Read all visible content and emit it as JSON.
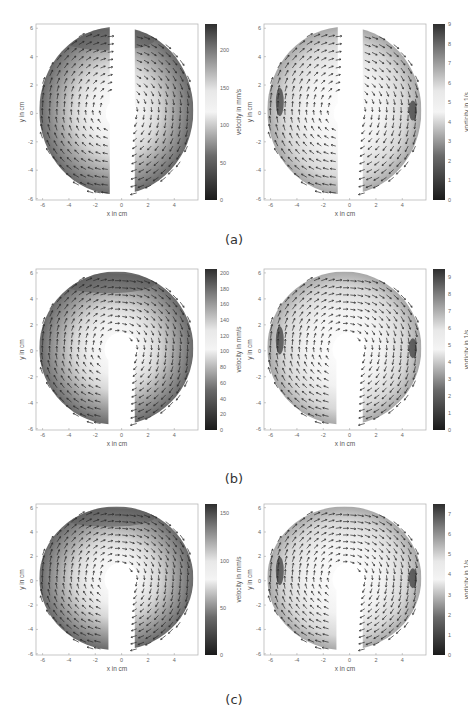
{
  "figure": {
    "rows": [
      {
        "caption": "(a)",
        "panels": [
          {
            "id": "a-velocity",
            "xlabel": "x in cm",
            "ylabel": "y in cm",
            "colorbar_label": "velocity in mm/s",
            "colorbar_ticks": [
              "0",
              "50",
              "100",
              "150",
              "200"
            ],
            "colorbar_max": 235,
            "mask": "split",
            "field": "velocity"
          },
          {
            "id": "a-vorticity",
            "xlabel": "x in cm",
            "ylabel": "y in cm",
            "colorbar_label": "vorticity in 1/s",
            "colorbar_ticks": [
              "0",
              "1",
              "2",
              "3",
              "4",
              "5",
              "6",
              "7",
              "8",
              "9"
            ],
            "colorbar_max": 9,
            "mask": "split",
            "field": "vorticity"
          }
        ]
      },
      {
        "caption": "(b)",
        "panels": [
          {
            "id": "b-velocity",
            "xlabel": "x in cm",
            "ylabel": "y in cm",
            "colorbar_label": "velocity in mm/s",
            "colorbar_ticks": [
              "0",
              "20",
              "40",
              "60",
              "80",
              "100",
              "120",
              "140",
              "160",
              "180",
              "200"
            ],
            "colorbar_max": 205,
            "mask": "keyhole",
            "field": "velocity"
          },
          {
            "id": "b-vorticity",
            "xlabel": "x in cm",
            "ylabel": "y in cm",
            "colorbar_label": "vorticity in 1/s",
            "colorbar_ticks": [
              "0",
              "1",
              "2",
              "3",
              "4",
              "5",
              "6",
              "7",
              "8",
              "9"
            ],
            "colorbar_max": 9.5,
            "mask": "keyhole",
            "field": "vorticity"
          }
        ]
      },
      {
        "caption": "(c)",
        "panels": [
          {
            "id": "c-velocity",
            "xlabel": "x in cm",
            "ylabel": "y in cm",
            "colorbar_label": "velocity in mm/s",
            "colorbar_ticks": [
              "0",
              "50",
              "100",
              "150"
            ],
            "colorbar_max": 160,
            "mask": "keyhole",
            "field": "velocity"
          },
          {
            "id": "c-vorticity",
            "xlabel": "x in cm",
            "ylabel": "y in cm",
            "colorbar_label": "vorticity in 1/s",
            "colorbar_ticks": [
              "0",
              "1",
              "2",
              "3",
              "4",
              "5",
              "6",
              "7"
            ],
            "colorbar_max": 7.5,
            "mask": "keyhole",
            "field": "vorticity"
          }
        ]
      }
    ],
    "axes": {
      "x_ticks": [
        "-6",
        "-4",
        "-2",
        "0",
        "2",
        "4"
      ],
      "y_ticks": [
        "-6",
        "-4",
        "-2",
        "0",
        "2",
        "4",
        "6"
      ],
      "xlim": [
        -6.5,
        5.8
      ],
      "ylim": [
        -6.1,
        6.3
      ]
    },
    "colors": {
      "frame": "#b8b8b8",
      "arrow": "#2a2a2a",
      "colormap_low": "#1a1a1a",
      "colormap_mid": "#f4f4f4",
      "colormap_high": "#2e2e2e"
    }
  }
}
